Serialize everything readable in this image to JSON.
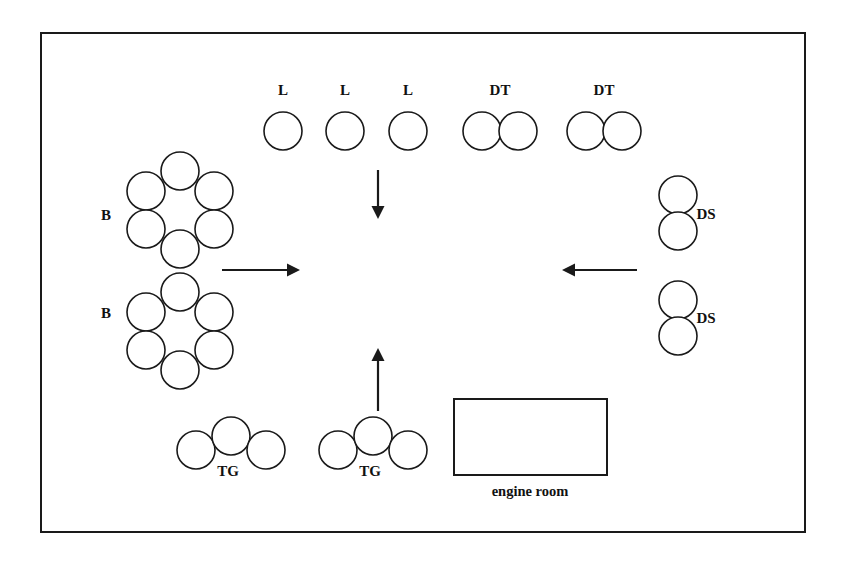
{
  "figure": {
    "background_color": "#ffffff",
    "stroke_color": "#1a1a1a",
    "width": 843,
    "height": 565
  },
  "frame": {
    "name": "outer-border",
    "x": 41,
    "y": 33,
    "width": 764,
    "height": 499
  },
  "chart_data": {
    "type": "diagram",
    "legend_codes": [
      "L",
      "DT",
      "B",
      "DS",
      "TG"
    ],
    "circle_radius": 19,
    "groups": [
      {
        "id": "l-1",
        "label": "L",
        "kind": "single",
        "count": 1,
        "label_x": 283,
        "label_y": 95,
        "circles": [
          {
            "cx": 283,
            "cy": 131
          }
        ]
      },
      {
        "id": "l-2",
        "label": "L",
        "kind": "single",
        "count": 1,
        "label_x": 345,
        "label_y": 95,
        "circles": [
          {
            "cx": 345,
            "cy": 131
          }
        ]
      },
      {
        "id": "l-3",
        "label": "L",
        "kind": "single",
        "count": 1,
        "label_x": 408,
        "label_y": 95,
        "circles": [
          {
            "cx": 408,
            "cy": 131
          }
        ]
      },
      {
        "id": "dt-1",
        "label": "DT",
        "kind": "horizontal-pair",
        "count": 2,
        "label_x": 500,
        "label_y": 95,
        "circles": [
          {
            "cx": 482,
            "cy": 131
          },
          {
            "cx": 518,
            "cy": 131
          }
        ]
      },
      {
        "id": "dt-2",
        "label": "DT",
        "kind": "horizontal-pair",
        "count": 2,
        "label_x": 604,
        "label_y": 95,
        "circles": [
          {
            "cx": 586,
            "cy": 131
          },
          {
            "cx": 622,
            "cy": 131
          }
        ]
      },
      {
        "id": "b-1",
        "label": "B",
        "kind": "hex-rosette",
        "count": 6,
        "label_x": 106,
        "label_y": 220,
        "circles": [
          {
            "cx": 180,
            "cy": 171
          },
          {
            "cx": 146,
            "cy": 191
          },
          {
            "cx": 214,
            "cy": 191
          },
          {
            "cx": 146,
            "cy": 229
          },
          {
            "cx": 214,
            "cy": 229
          },
          {
            "cx": 180,
            "cy": 249
          }
        ]
      },
      {
        "id": "b-2",
        "label": "B",
        "kind": "hex-rosette",
        "count": 6,
        "label_x": 106,
        "label_y": 318,
        "circles": [
          {
            "cx": 180,
            "cy": 292
          },
          {
            "cx": 146,
            "cy": 312
          },
          {
            "cx": 214,
            "cy": 312
          },
          {
            "cx": 146,
            "cy": 350
          },
          {
            "cx": 214,
            "cy": 350
          },
          {
            "cx": 180,
            "cy": 370
          }
        ]
      },
      {
        "id": "ds-1",
        "label": "DS",
        "kind": "vertical-pair",
        "count": 2,
        "label_x": 706,
        "label_y": 219,
        "circles": [
          {
            "cx": 678,
            "cy": 195
          },
          {
            "cx": 678,
            "cy": 231
          }
        ]
      },
      {
        "id": "ds-2",
        "label": "DS",
        "kind": "vertical-pair",
        "count": 2,
        "label_x": 706,
        "label_y": 323,
        "circles": [
          {
            "cx": 678,
            "cy": 300
          },
          {
            "cx": 678,
            "cy": 336
          }
        ]
      },
      {
        "id": "tg-1",
        "label": "TG",
        "kind": "triple-arc",
        "count": 3,
        "label_x": 228,
        "label_y": 476,
        "circles": [
          {
            "cx": 196,
            "cy": 450
          },
          {
            "cx": 231,
            "cy": 436
          },
          {
            "cx": 266,
            "cy": 450
          }
        ]
      },
      {
        "id": "tg-2",
        "label": "TG",
        "kind": "triple-arc",
        "count": 3,
        "label_x": 370,
        "label_y": 476,
        "circles": [
          {
            "cx": 338,
            "cy": 450
          },
          {
            "cx": 373,
            "cy": 436
          },
          {
            "cx": 408,
            "cy": 450
          }
        ]
      }
    ],
    "rooms": [
      {
        "id": "engine-room",
        "label": "engine room",
        "x": 454,
        "y": 399,
        "width": 153,
        "height": 76,
        "label_x": 530,
        "label_y": 496
      }
    ],
    "arrows": [
      {
        "id": "arrow-down",
        "direction": "down",
        "x1": 378,
        "y1": 170,
        "x2": 378,
        "y2": 219
      },
      {
        "id": "arrow-right",
        "direction": "right",
        "x1": 222,
        "y1": 270,
        "x2": 300,
        "y2": 270
      },
      {
        "id": "arrow-left",
        "direction": "left",
        "x1": 637,
        "y1": 270,
        "x2": 562,
        "y2": 270
      },
      {
        "id": "arrow-up",
        "direction": "up",
        "x1": 378,
        "y1": 411,
        "x2": 378,
        "y2": 348
      }
    ]
  }
}
